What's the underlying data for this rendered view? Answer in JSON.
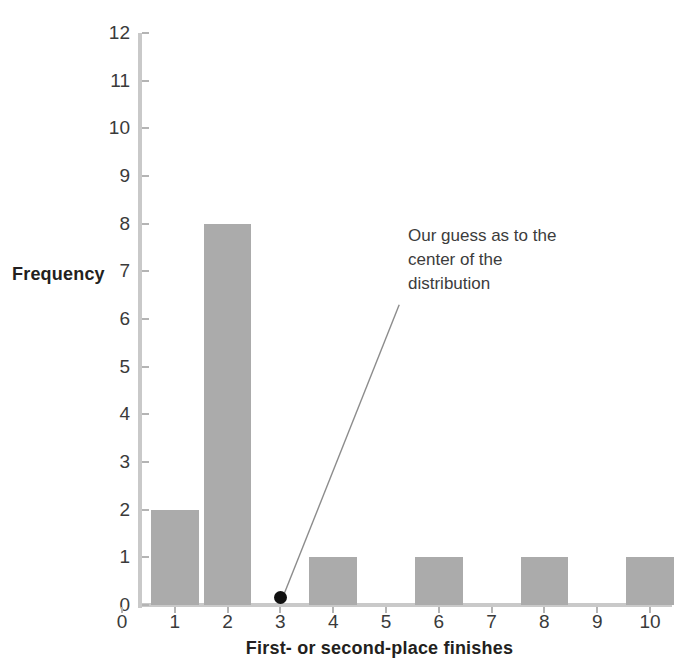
{
  "chart_data": {
    "type": "bar",
    "title": "",
    "subtitle": "",
    "xlabel": "First- or second-place finishes",
    "ylabel": "Frequency",
    "categories": [
      0,
      1,
      2,
      3,
      4,
      5,
      6,
      7,
      8,
      9,
      10
    ],
    "values": [
      0,
      2,
      8,
      0,
      1,
      0,
      1,
      0,
      1,
      0,
      1
    ],
    "series": [
      {
        "name": "Frequency",
        "values": [
          0,
          2,
          8,
          0,
          1,
          0,
          1,
          0,
          1,
          0,
          1
        ]
      }
    ],
    "xlim": [
      0,
      10
    ],
    "ylim": [
      0,
      12
    ],
    "x_ticks": [
      "0",
      "1",
      "2",
      "3",
      "4",
      "5",
      "6",
      "7",
      "8",
      "9",
      "10"
    ],
    "y_ticks": [
      "0",
      "1",
      "2",
      "3",
      "4",
      "5",
      "6",
      "7",
      "8",
      "9",
      "10",
      "11",
      "12"
    ],
    "grid": false,
    "legend": null,
    "bar_color": "#ababab",
    "axis_color": "#c9c9c9",
    "text_color": "#231f20",
    "annotations": [
      {
        "name": "center-of-distribution-callout",
        "lines": [
          "Our guess as to the",
          "center of the",
          "distribution"
        ],
        "marker": {
          "x": 3,
          "y": 0.15,
          "color": "#111111",
          "shape": "dot"
        },
        "leader_line": {
          "from_x": 3,
          "from_y": 0.15,
          "to_x": 5.25,
          "to_y": 6.3,
          "color": "#8c8c8c"
        }
      }
    ]
  },
  "annotation": {
    "line1": "Our guess as to the",
    "line2": "center of the",
    "line3": "distribution"
  }
}
